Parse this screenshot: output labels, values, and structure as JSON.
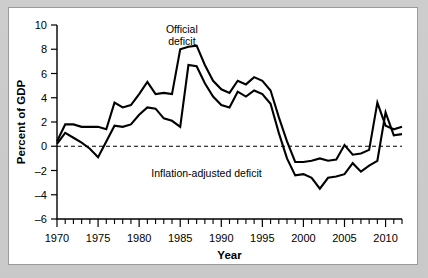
{
  "figure": {
    "background_color": "#c9c9c9",
    "card_color": "#ffffff",
    "border_color": "#9a9a9a",
    "line_color": "#000000"
  },
  "chart_data": {
    "type": "line",
    "title": "",
    "xlabel": "Year",
    "ylabel": "Percent of GDP",
    "xlim": [
      1970,
      2012
    ],
    "ylim": [
      -6,
      10
    ],
    "ytick_labels": [
      "10",
      "8",
      "6",
      "4",
      "2",
      "0",
      "–2",
      "–4",
      "–6"
    ],
    "ytick_values": [
      10,
      8,
      6,
      4,
      2,
      0,
      -2,
      -4,
      -6
    ],
    "xtick_labels": [
      "1970",
      "1975",
      "1980",
      "1985",
      "1990",
      "1995",
      "2000",
      "2005",
      "2010"
    ],
    "xtick_values": [
      1970,
      1975,
      1980,
      1985,
      1990,
      1995,
      2000,
      2005,
      2010
    ],
    "xtick_minor_step": 1,
    "grid": false,
    "zero_reference_line": 0,
    "zero_line_style": "dashed",
    "legend_position": "inline-annotation",
    "annotations": [
      {
        "text": "Official",
        "x": 1985.2,
        "y": 9.35
      },
      {
        "text": "deficit",
        "x": 1985.2,
        "y": 8.35
      },
      {
        "text": "Inflation-adjusted deficit",
        "x": 1988.2,
        "y": -2.55
      }
    ],
    "x": [
      1970,
      1971,
      1972,
      1973,
      1974,
      1975,
      1976,
      1977,
      1978,
      1979,
      1980,
      1981,
      1982,
      1983,
      1984,
      1985,
      1986,
      1987,
      1988,
      1989,
      1990,
      1991,
      1992,
      1993,
      1994,
      1995,
      1996,
      1997,
      1998,
      1999,
      2000,
      2001,
      2002,
      2003,
      2004,
      2005,
      2006,
      2007,
      2008,
      2009,
      2010,
      2011,
      2012
    ],
    "series": [
      {
        "name": "Official deficit",
        "values": [
          0.3,
          2.1,
          1.9,
          1.1,
          0.4,
          3.3,
          4.2,
          2.7,
          2.6,
          1.6,
          2.7,
          2.5,
          4.0,
          5.9,
          4.7,
          5.0,
          4.9,
          3.1,
          3.0,
          2.7,
          3.8,
          4.4,
          4.6,
          3.8,
          2.8,
          2.2,
          1.3,
          0.2,
          -0.8,
          -1.3,
          -2.3,
          -1.2,
          1.4,
          3.4,
          3.4,
          2.5,
          1.8,
          1.1,
          3.1,
          9.8,
          8.8,
          8.4,
          6.8
        ],
        "reading_note": "Upper curve; peaks ~8.3 at 1983, trough ~–2.3 at 2000, spike ~3.6 at 2009 in plotted range"
      },
      {
        "name": "Inflation-adjusted deficit",
        "values": [
          -0.4,
          1.0,
          0.7,
          0.0,
          -1.0,
          1.5,
          2.8,
          1.6,
          1.5,
          0.3,
          0.9,
          0.4,
          2.6,
          4.6,
          3.6,
          3.8,
          3.8,
          2.0,
          1.9,
          1.6,
          2.6,
          3.3,
          3.6,
          2.9,
          1.9,
          1.3,
          0.3,
          -0.8,
          -1.8,
          -2.4,
          -3.4,
          -2.2,
          0.3,
          2.3,
          2.3,
          1.4,
          0.7,
          0.1,
          2.0,
          8.6,
          7.6,
          7.3,
          5.8
        ],
        "reading_note": "Lower curve; peaks ~6.6 at 1983, trough ~–3.5 at 2000"
      }
    ],
    "plotted_series_values": {
      "official": [
        [
          1970,
          0.4
        ],
        [
          1971,
          1.8
        ],
        [
          1972,
          1.8
        ],
        [
          1973,
          1.6
        ],
        [
          1974,
          1.6
        ],
        [
          1975,
          1.6
        ],
        [
          1976,
          1.4
        ],
        [
          1977,
          3.6
        ],
        [
          1978,
          3.2
        ],
        [
          1979,
          3.4
        ],
        [
          1980,
          4.3
        ],
        [
          1981,
          5.3
        ],
        [
          1982,
          4.3
        ],
        [
          1983,
          4.4
        ],
        [
          1984,
          4.3
        ],
        [
          1985,
          8.0
        ],
        [
          1986,
          8.2
        ],
        [
          1987,
          8.3
        ],
        [
          1988,
          6.7
        ],
        [
          1989,
          5.4
        ],
        [
          1990,
          4.7
        ],
        [
          1991,
          4.4
        ],
        [
          1992,
          5.4
        ],
        [
          1993,
          5.1
        ],
        [
          1994,
          5.7
        ],
        [
          1995,
          5.4
        ],
        [
          1996,
          4.6
        ],
        [
          1997,
          2.4
        ],
        [
          1998,
          0.4
        ],
        [
          1999,
          -1.3
        ],
        [
          2000,
          -1.3
        ],
        [
          2001,
          -1.2
        ],
        [
          2002,
          -1.0
        ],
        [
          2003,
          -1.2
        ],
        [
          2004,
          -1.1
        ],
        [
          2005,
          0.1
        ],
        [
          2006,
          -0.7
        ],
        [
          2007,
          -0.6
        ],
        [
          2008,
          -0.3
        ],
        [
          2009,
          3.6
        ],
        [
          2010,
          1.7
        ],
        [
          2011,
          1.4
        ],
        [
          2012,
          1.6
        ]
      ],
      "inflation_adjusted": [
        [
          1970,
          0.2
        ],
        [
          1971,
          1.1
        ],
        [
          1972,
          0.7
        ],
        [
          1973,
          0.3
        ],
        [
          1974,
          -0.2
        ],
        [
          1975,
          -0.9
        ],
        [
          1976,
          0.4
        ],
        [
          1977,
          1.7
        ],
        [
          1978,
          1.6
        ],
        [
          1979,
          1.8
        ],
        [
          1980,
          2.6
        ],
        [
          1981,
          3.2
        ],
        [
          1982,
          3.1
        ],
        [
          1983,
          2.3
        ],
        [
          1984,
          2.1
        ],
        [
          1985,
          1.6
        ],
        [
          1986,
          6.7
        ],
        [
          1987,
          6.6
        ],
        [
          1988,
          5.2
        ],
        [
          1989,
          4.1
        ],
        [
          1990,
          3.4
        ],
        [
          1991,
          3.2
        ],
        [
          1992,
          4.5
        ],
        [
          1993,
          4.1
        ],
        [
          1994,
          4.6
        ],
        [
          1995,
          4.3
        ],
        [
          1996,
          3.5
        ],
        [
          1997,
          1.1
        ],
        [
          1998,
          -1.0
        ],
        [
          1999,
          -2.4
        ],
        [
          2000,
          -2.3
        ],
        [
          2001,
          -2.6
        ],
        [
          2002,
          -3.5
        ],
        [
          2003,
          -2.6
        ],
        [
          2004,
          -2.5
        ],
        [
          2005,
          -2.3
        ],
        [
          2006,
          -1.4
        ],
        [
          2007,
          -2.1
        ],
        [
          2008,
          -1.6
        ],
        [
          2009,
          -1.2
        ],
        [
          2010,
          2.8
        ],
        [
          2011,
          0.9
        ],
        [
          2012,
          1.0
        ]
      ]
    }
  }
}
